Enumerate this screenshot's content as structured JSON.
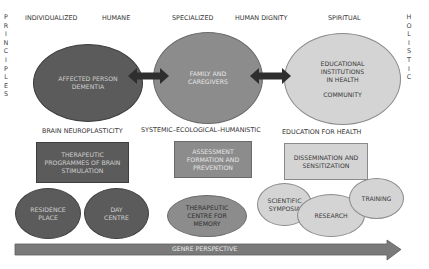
{
  "side_labels": {
    "left": "PRINCIPLES",
    "right": "HOLISTIC"
  },
  "principles": [
    {
      "label": "INDIVIDUALIZED"
    },
    {
      "label": "HUMANE"
    },
    {
      "label": "SPECIALIZED"
    },
    {
      "label": "HUMAN DIGNITY"
    },
    {
      "label": "SPIRITUAL"
    }
  ],
  "main_nodes": [
    {
      "lines": [
        "AFFECTED PERSON",
        "DEMENTIA"
      ],
      "shade": "dark"
    },
    {
      "lines": [
        "FAMILY AND",
        "CAREGIVERS"
      ],
      "shade": "mid"
    },
    {
      "lines": [
        "EDUCATIONAL",
        "INSTITUTIONS",
        "IN HEALTH",
        "",
        "COMMUNITY"
      ],
      "shade": "light"
    }
  ],
  "connectors": [
    {
      "from": "AFFECTED PERSON DEMENTIA",
      "to": "FAMILY AND CAREGIVERS",
      "type": "double-arrow"
    },
    {
      "from": "FAMILY AND CAREGIVERS",
      "to": "EDUCATIONAL INSTITUTIONS IN HEALTH / COMMUNITY",
      "type": "double-arrow"
    }
  ],
  "approaches": [
    {
      "label": "BRAIN NEUROPLASTICITY"
    },
    {
      "label": "SYSTEMIC–ECOLOGICAL–HUMANISTIC"
    },
    {
      "label": "EDUCATION FOR HEALTH"
    }
  ],
  "programmes": [
    {
      "lines": [
        "THERAPEUTIC",
        "PROGRAMMES OF BRAIN",
        "STIMULATION"
      ],
      "shade": "dark"
    },
    {
      "lines": [
        "ASSESSMENT",
        "FORMATION AND",
        "PREVENTION"
      ],
      "shade": "mid"
    },
    {
      "lines": [
        "DISSEMINATION AND",
        "SENSITIZATION"
      ],
      "shade": "light"
    }
  ],
  "settings": [
    {
      "lines": [
        "RESIDENCE",
        "PLACE"
      ],
      "shade": "dark"
    },
    {
      "lines": [
        "DAY",
        "CENTRE"
      ],
      "shade": "dark"
    },
    {
      "lines": [
        "THERAPEUTIC",
        "CENTRE FOR",
        "MEMORY"
      ],
      "shade": "mid"
    },
    {
      "lines": [
        "SCIENTIFIC",
        "SYMPOSIA"
      ],
      "shade": "light"
    },
    {
      "lines": [
        "RESEARCH"
      ],
      "shade": "light"
    },
    {
      "lines": [
        "TRAINING"
      ],
      "shade": "light"
    }
  ],
  "bottom_arrow": {
    "label": "GENRE PERSPECTIVE"
  },
  "colors": {
    "dark": "#5b5b5b",
    "mid": "#8c8c8c",
    "light": "#d4d4d4",
    "arrow": "#2e2e2e",
    "bottom_arrow": "#7a7a7a"
  }
}
